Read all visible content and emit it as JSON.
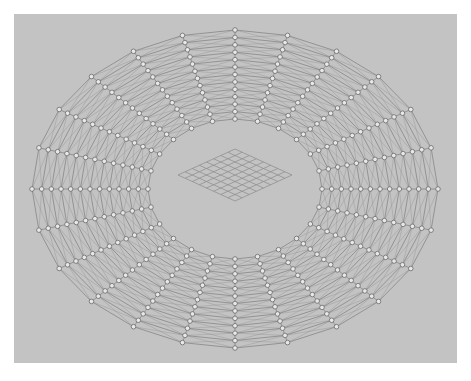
{
  "figure": {
    "background_color": "#ffffff",
    "panel_color": "#c3c3c3",
    "panel": {
      "x": 14,
      "y": 14,
      "width": 443,
      "height": 349
    }
  },
  "chart_data": {
    "type": "scatter",
    "title": "",
    "xlabel": "",
    "ylabel": "",
    "grid": false,
    "legend": null,
    "annulus": {
      "center_x": 221,
      "center_y": 175,
      "outer_radius_x": 203,
      "outer_radius_y": 159,
      "inner_radius_x": 87,
      "inner_radius_y": 70,
      "ring_count": 13,
      "spoke_count": 24,
      "node_count": 312,
      "node_radius": 2.3,
      "node_fill": "#e8e8e8",
      "node_stroke": "#6a6a6a",
      "edge_color": "#7a7a7a",
      "diagonal_color": "#8e8e8e",
      "edge_width": 0.7,
      "diagonal_width": 0.45
    },
    "center_plate": {
      "shape": "skewed-square-grid",
      "cells_u": 8,
      "cells_v": 8,
      "center_x": 221,
      "center_y": 161,
      "half_width": 57,
      "half_height": 26,
      "skew": 0.0,
      "line_color": "#8a8a8a",
      "line_width": 0.7
    }
  },
  "labels": {
    "mesh_name": "annular-mesh",
    "plate_name": "center-plate-grid"
  }
}
